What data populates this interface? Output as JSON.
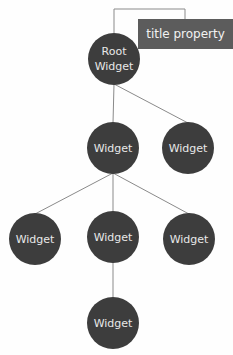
{
  "diagram": {
    "annotation": {
      "text": "title property",
      "attached_to": "root"
    },
    "nodes": [
      {
        "id": "root",
        "lines": [
          "Root",
          "Widget"
        ]
      },
      {
        "id": "w1",
        "lines": [
          "Widget"
        ]
      },
      {
        "id": "w2",
        "lines": [
          "Widget"
        ]
      },
      {
        "id": "w3",
        "lines": [
          "Widget"
        ]
      },
      {
        "id": "w4",
        "lines": [
          "Widget"
        ]
      },
      {
        "id": "w5",
        "lines": [
          "Widget"
        ]
      },
      {
        "id": "w6",
        "lines": [
          "Widget"
        ]
      }
    ],
    "edges": [
      [
        "root",
        "w1"
      ],
      [
        "root",
        "w2"
      ],
      [
        "w1",
        "w3"
      ],
      [
        "w1",
        "w4"
      ],
      [
        "w1",
        "w5"
      ],
      [
        "w4",
        "w6"
      ]
    ]
  }
}
